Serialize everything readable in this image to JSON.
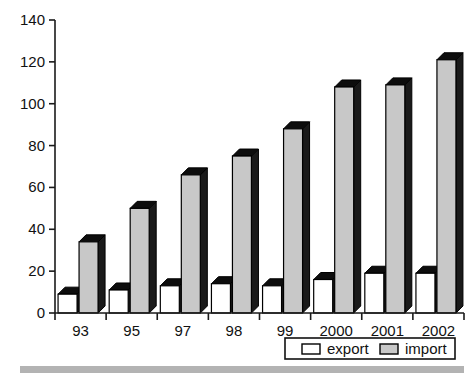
{
  "chart_data": {
    "type": "bar",
    "title": "",
    "subtitle": "",
    "xlabel": "",
    "ylabel": "",
    "categories": [
      "93",
      "95",
      "97",
      "98",
      "99",
      "2000",
      "2001",
      "2002"
    ],
    "series": [
      {
        "name": "export",
        "values": [
          9,
          11,
          13,
          14,
          13,
          16,
          19,
          19
        ],
        "color": "#ffffff"
      },
      {
        "name": "import",
        "values": [
          34,
          50,
          66,
          75,
          88,
          108,
          109,
          121
        ],
        "color": "#c8c8c8"
      }
    ],
    "ylim": [
      0,
      140
    ],
    "yticks": [
      0,
      20,
      40,
      60,
      80,
      100,
      120,
      140
    ],
    "ytick_labels": [
      "0",
      "20",
      "40",
      "60",
      "80",
      "100",
      "120",
      "140"
    ],
    "grid": false,
    "legend_position": "bottom-right",
    "legend_entries": [
      {
        "label": "export",
        "swatch_color": "#ffffff"
      },
      {
        "label": "import",
        "swatch_color": "#c8c8c8"
      }
    ],
    "style": {
      "three_d": true,
      "depth_px": 7,
      "bar_outline": "#000000",
      "axis_color": "#1a1a1a",
      "background": "#ffffff",
      "footer_bar_color": "#b3b3b3"
    }
  },
  "axis": {
    "y_ticks": [
      "140",
      "120",
      "100",
      "80",
      "60",
      "40",
      "20",
      "0"
    ],
    "x_ticks": [
      "93",
      "95",
      "97",
      "98",
      "99",
      "2000",
      "2001",
      "2002"
    ]
  },
  "legend": {
    "export_label": "export",
    "import_label": "import"
  }
}
